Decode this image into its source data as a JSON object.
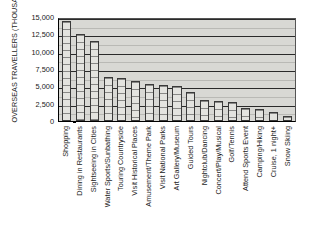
{
  "chart_data": {
    "type": "bar",
    "title": "",
    "xlabel": "",
    "ylabel": "OVERSEAS TRAVELLERS (THOUSANDS)",
    "ylim": [
      0,
      15000
    ],
    "ytick_step": 2500,
    "ytick_labels": [
      "15,000",
      "12,500",
      "10,000",
      "7,500",
      "5,000",
      "2,500",
      "0"
    ],
    "ytick_values": [
      15000,
      12500,
      10000,
      7500,
      5000,
      2500,
      0
    ],
    "grid": true,
    "grid_axis": "y",
    "legend": false,
    "orientation": "vertical",
    "categories": [
      "Shopping",
      "Dining in Restaurants",
      "Sightseeing in Cities",
      "Water Sports/Sunbathing",
      "Touring Countryside",
      "Visit Historical Places",
      "Amusement/Theme Park",
      "Visit National Parks",
      "Art Gallery/Museum",
      "Guided Tours",
      "Nightclub/Dancing",
      "Concert/Play/Musical",
      "Golf/Tennis",
      "Attend Sports Event",
      "Camping/Hiking",
      "Cruise, 1 night+",
      "Snow Skiing"
    ],
    "values": [
      14400,
      12500,
      11600,
      6300,
      6200,
      5800,
      5400,
      5200,
      5000,
      4200,
      3000,
      2900,
      2800,
      1900,
      1800,
      1300,
      700
    ],
    "colors": {
      "bar_fill": "#e3e3df",
      "bar_edge": "#3a3a3a",
      "plot_background": "#d8d8d4",
      "gridline": "#2a2a2a",
      "axis": "#000000"
    }
  }
}
